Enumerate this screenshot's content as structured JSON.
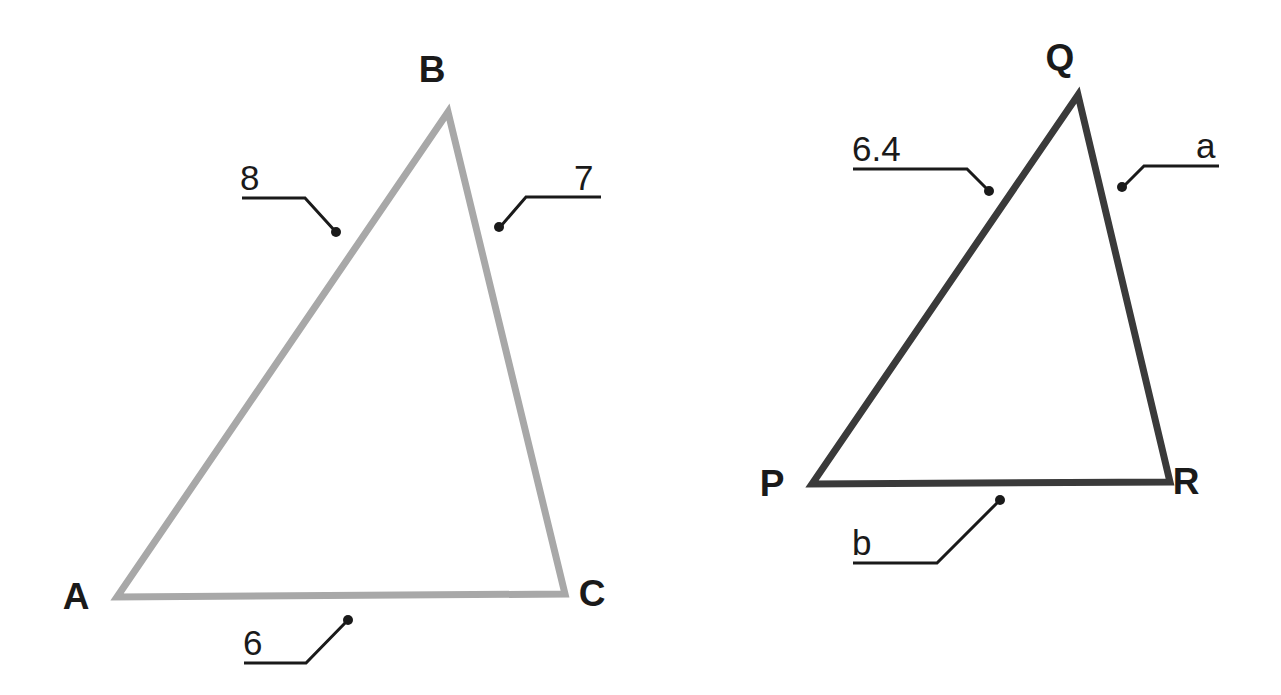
{
  "figure": {
    "type": "similar-triangles-diagram",
    "background_color": "#ffffff"
  },
  "triangles": [
    {
      "id": "triangle-abc",
      "name": "Triangle ABC",
      "stroke_color": "#a8a8a8",
      "stroke_width": 7,
      "vertices": [
        {
          "label": "A",
          "x": 117,
          "y": 597,
          "label_x": 76,
          "label_y": 609
        },
        {
          "label": "B",
          "x": 448,
          "y": 112,
          "label_x": 432,
          "label_y": 82
        },
        {
          "label": "C",
          "x": 565,
          "y": 594,
          "label_x": 592,
          "label_y": 606
        }
      ],
      "side_labels": [
        {
          "id": "side-ab",
          "text": "8",
          "text_x": 240,
          "text_y": 190,
          "leader": "M 242 198 L 305 198 L 335 231",
          "dot_x": 336,
          "dot_y": 232
        },
        {
          "id": "side-bc",
          "text": "7",
          "text_x": 574,
          "text_y": 190,
          "leader": "M 601 197 L 526 197 L 501 226",
          "dot_x": 499,
          "dot_y": 227
        },
        {
          "id": "side-ac",
          "text": "6",
          "text_x": 243,
          "text_y": 655,
          "leader": "M 244 663 L 306 663 L 347 621",
          "dot_x": 348,
          "dot_y": 620
        }
      ]
    },
    {
      "id": "triangle-pqr",
      "name": "Triangle PQR",
      "stroke_color": "#3a3a3a",
      "stroke_width": 7,
      "vertices": [
        {
          "label": "P",
          "x": 812,
          "y": 484,
          "label_x": 772,
          "label_y": 496
        },
        {
          "label": "Q",
          "x": 1078,
          "y": 95,
          "label_x": 1060,
          "label_y": 70
        },
        {
          "label": "R",
          "x": 1170,
          "y": 482,
          "label_x": 1186,
          "label_y": 494
        }
      ],
      "side_labels": [
        {
          "id": "side-pq",
          "text": "6.4",
          "text_x": 852,
          "text_y": 161,
          "leader": "M 853 169 L 967 169 L 988 190",
          "dot_x": 989,
          "dot_y": 191
        },
        {
          "id": "side-qr",
          "text": "a",
          "text_x": 1196,
          "text_y": 158,
          "leader": "M 1219 166 L 1144 166 L 1124 186",
          "dot_x": 1122,
          "dot_y": 187
        },
        {
          "id": "side-pr",
          "text": "b",
          "text_x": 852,
          "text_y": 555,
          "leader": "M 853 563 L 937 563 L 999 501",
          "dot_x": 1000,
          "dot_y": 500
        }
      ]
    }
  ],
  "leader_style": {
    "stroke_color": "#1a1a1a",
    "stroke_width": 3,
    "dot_radius": 5
  }
}
